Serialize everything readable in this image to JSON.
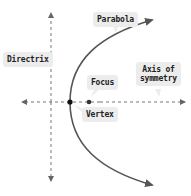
{
  "diagram": {
    "labels": {
      "parabola": "Parabola",
      "directrix": "Directrix",
      "focus": "Focus",
      "vertex": "Vertex",
      "axis_line1": "Axis of",
      "axis_line2": "symmetry"
    },
    "colors": {
      "curve": "#555555",
      "dashed": "#777777",
      "label_bg": "#ececec",
      "text": "#222222",
      "vertex_dot": "#111111",
      "focus_dot": "#333333"
    },
    "geometry": {
      "vertex": [
        70,
        102
      ],
      "focus": [
        89,
        102
      ],
      "directrix_x": 51,
      "axis_y": 102
    }
  }
}
